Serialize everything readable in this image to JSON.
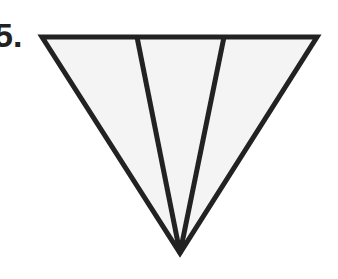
{
  "problem": {
    "label": "5."
  },
  "figure": {
    "shape": "inverted triangle divided into three triangles",
    "colors": {
      "stroke": "#222222",
      "fill": "#f4f4f4"
    },
    "vertices": {
      "top_left": [
        42,
        37
      ],
      "top_right": [
        317,
        37
      ],
      "bottom": [
        180,
        253
      ]
    },
    "dividers": [
      {
        "top": [
          137,
          37
        ],
        "bottom": [
          180,
          253
        ]
      },
      {
        "top": [
          224,
          37
        ],
        "bottom": [
          180,
          253
        ]
      }
    ]
  }
}
